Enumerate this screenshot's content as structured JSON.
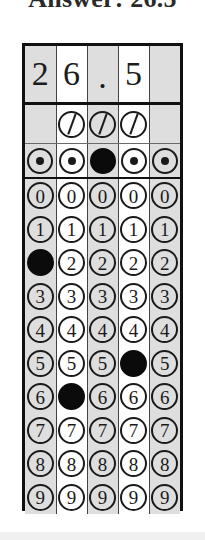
{
  "heading": {
    "text": "Answer: 26.5"
  },
  "grid": {
    "columns": 5,
    "column_shading": [
      "shade",
      "plain",
      "shade",
      "plain",
      "shade"
    ],
    "written_row": {
      "label": "handwritten-answer-row",
      "values": [
        "2",
        "6",
        ".",
        "5",
        ""
      ]
    },
    "fraction_row": {
      "label": "fraction-bar-row",
      "glyph": "/",
      "present": [
        false,
        true,
        true,
        true,
        false
      ],
      "filled": [
        false,
        false,
        false,
        false,
        false
      ]
    },
    "decimal_row": {
      "label": "decimal-point-row",
      "glyph": "·",
      "present": [
        true,
        true,
        true,
        true,
        true
      ],
      "filled": [
        false,
        false,
        true,
        false,
        false
      ]
    },
    "digit_rows": [
      {
        "digit": "0",
        "filled": [
          false,
          false,
          false,
          false,
          false
        ]
      },
      {
        "digit": "1",
        "filled": [
          false,
          false,
          false,
          false,
          false
        ]
      },
      {
        "digit": "2",
        "filled": [
          true,
          false,
          false,
          false,
          false
        ]
      },
      {
        "digit": "3",
        "filled": [
          false,
          false,
          false,
          false,
          false
        ]
      },
      {
        "digit": "4",
        "filled": [
          false,
          false,
          false,
          false,
          false
        ]
      },
      {
        "digit": "5",
        "filled": [
          false,
          false,
          false,
          true,
          false
        ]
      },
      {
        "digit": "6",
        "filled": [
          false,
          true,
          false,
          false,
          false
        ]
      },
      {
        "digit": "7",
        "filled": [
          false,
          false,
          false,
          false,
          false
        ]
      },
      {
        "digit": "8",
        "filled": [
          false,
          false,
          false,
          false,
          false
        ]
      },
      {
        "digit": "9",
        "filled": [
          false,
          false,
          false,
          false,
          false
        ]
      }
    ]
  },
  "colors": {
    "ink": "#1a1a1a",
    "frame": "#111111",
    "shaded_column": "#dedede",
    "plain_column": "#ffffff",
    "filled_bubble": "#0b0b0b"
  }
}
